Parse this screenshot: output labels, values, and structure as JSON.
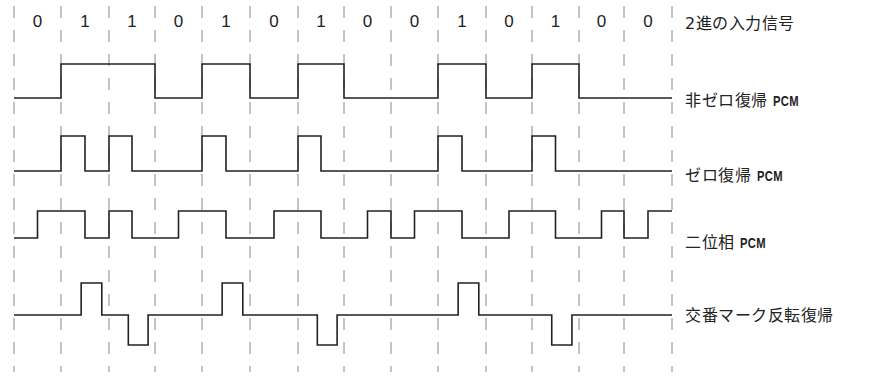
{
  "diagram": {
    "bit_boundaries_x": [
      14,
      61,
      109,
      155,
      202,
      250,
      298,
      344,
      391,
      438,
      486,
      532,
      579,
      624
    ],
    "input_bits": [
      0,
      1,
      1,
      0,
      1,
      0,
      1,
      0,
      0,
      1,
      0,
      1,
      0,
      0
    ],
    "colors": {
      "signal": "#222222",
      "grid": "#888888",
      "text": "#222222"
    },
    "rows": [
      {
        "id": "binary-input",
        "label": "2進の入力信号",
        "label_main": "2進の入力信号",
        "label_suffix": "",
        "label_y": 10
      },
      {
        "id": "nrz",
        "label": "非ゼロ復帰 PCM",
        "label_main": "非ゼロ復帰 ",
        "label_suffix": "PCM",
        "label_y": 87,
        "levels": {
          "high": 64,
          "low": 98
        }
      },
      {
        "id": "rz",
        "label": "ゼロ復帰 PCM",
        "label_main": "ゼロ復帰 ",
        "label_suffix": "PCM",
        "label_y": 162,
        "levels": {
          "high": 136,
          "low": 171
        }
      },
      {
        "id": "manchester",
        "label": "二位相 PCM",
        "label_main": "二位相 ",
        "label_suffix": "PCM",
        "label_y": 229,
        "levels": {
          "high": 211,
          "low": 238
        }
      },
      {
        "id": "ami",
        "label": "交番マーク反転復帰",
        "label_main": "交番マーク反転復帰",
        "label_suffix": "",
        "label_y": 302,
        "levels": {
          "high": 283,
          "zero": 315,
          "low": 345
        }
      }
    ]
  }
}
